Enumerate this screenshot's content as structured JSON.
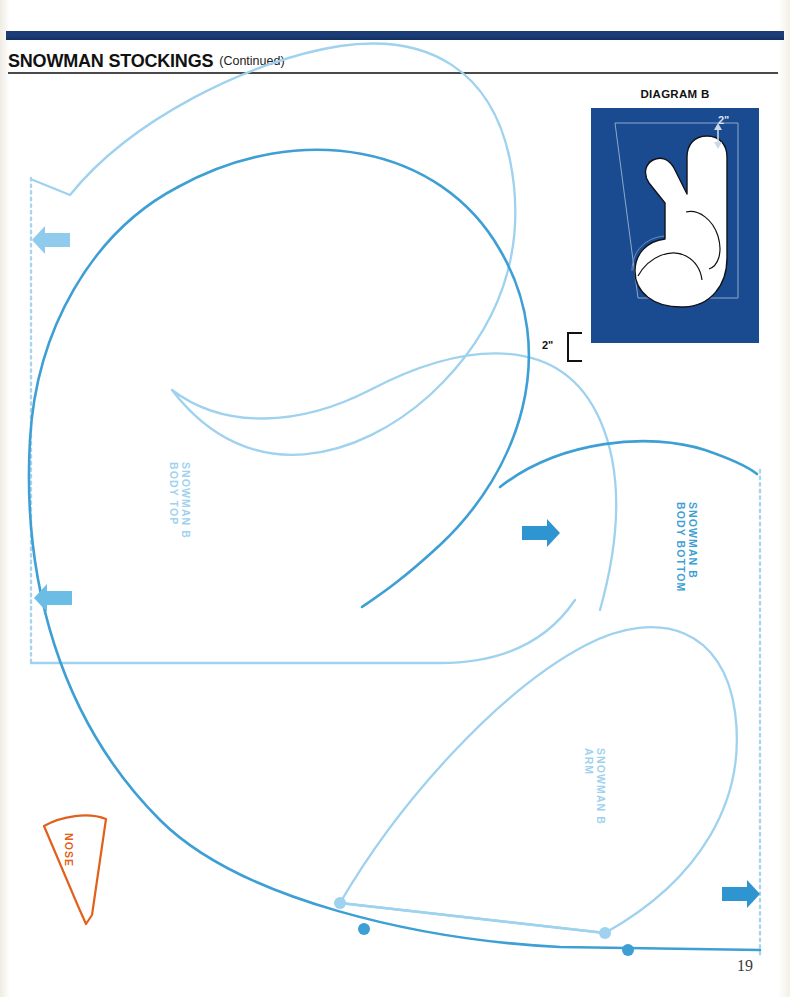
{
  "header": {
    "title": "SNOWMAN STOCKINGS",
    "subtitle": "(Continued)"
  },
  "page_number": "19",
  "diagram": {
    "label": "DIAGRAM B",
    "measure_top": "2\"",
    "measure_left": "2\"",
    "background_color": "#1a4a8f"
  },
  "pattern_pieces": [
    {
      "name": "snowman-b-body-top",
      "line1": "SNOWMAN B",
      "line2": "BODY TOP",
      "color": "#9ed2ee"
    },
    {
      "name": "snowman-b-body-bottom",
      "line1": "SNOWMAN B",
      "line2": "BODY BOTTOM",
      "color": "#3e9fd4"
    },
    {
      "name": "snowman-b-arm",
      "line1": "SNOWMAN B",
      "line2": "ARM",
      "color": "#9ed2ee"
    },
    {
      "name": "nose",
      "line1": "NOSE",
      "line2": "",
      "color": "#e2601c"
    }
  ],
  "colors": {
    "header_bar": "#1b3a73",
    "light_blue": "#9ed2ee",
    "medium_blue": "#3e9fd4",
    "orange": "#e2601c",
    "diagram_blue": "#1a4a8f"
  },
  "grain_arrows": [
    {
      "name": "grain-arrow-left-top",
      "direction": "left"
    },
    {
      "name": "grain-arrow-left-bottom",
      "direction": "left"
    },
    {
      "name": "grain-arrow-right-top",
      "direction": "right"
    },
    {
      "name": "grain-arrow-right-bottom",
      "direction": "right"
    }
  ]
}
